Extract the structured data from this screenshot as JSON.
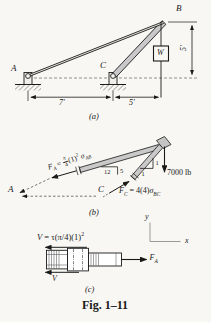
{
  "caption": "Fig. 1–11",
  "colors": {
    "member_fill": "#c9c9c9",
    "line": "#1a1a1a",
    "paper": "#f8f7f3"
  },
  "part_a": {
    "label": "(a)",
    "points": {
      "a": "A",
      "b": "B",
      "c": "C"
    },
    "weight": "W",
    "dims": {
      "span_ac": "7′",
      "span_cb": "5′",
      "height": "5′"
    }
  },
  "part_b": {
    "label": "(b)",
    "points": {
      "a": "A",
      "c": "C"
    },
    "load": "7000 lb",
    "force_a": {
      "f": "F",
      "sub": "A",
      "eq": "=",
      "frac_num": "π",
      "frac_den": "4",
      "term": "(1)",
      "exp": "2",
      "sigma": "σ",
      "sigma_sub": "AB"
    },
    "force_c": {
      "f": "F",
      "sub": "C",
      "eq": "= 4(4)",
      "sigma": "σ",
      "sigma_sub": "BC"
    },
    "slope_ab": {
      "run": "12",
      "rise": "5"
    },
    "slope_cb": {
      "rise": "1",
      "run": "1"
    }
  },
  "part_c": {
    "label": "(c)",
    "shear_eq": {
      "v": "V",
      "body": "= τ(π/4)(1)",
      "exp": "2"
    },
    "shear_v": "V",
    "force_a": {
      "f": "F",
      "sub": "A"
    },
    "axes": {
      "x": "x",
      "y": "y"
    }
  }
}
